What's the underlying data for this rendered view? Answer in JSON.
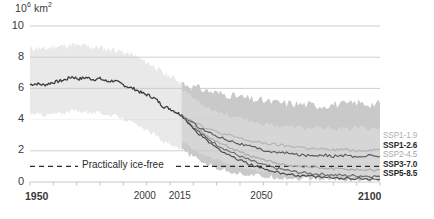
{
  "chart_data": {
    "type": "line",
    "title": "",
    "subtitle": "",
    "unit_label_prefix": "10",
    "unit_label_sup": "6",
    "unit_label_suffix": " km",
    "unit_label_suffix_sup": "2",
    "ylabel": "10^6 km^2",
    "xlabel": "",
    "ylim": [
      0,
      10
    ],
    "xlim": [
      1950,
      2100
    ],
    "yticks": [
      0,
      2,
      4,
      6,
      8,
      10
    ],
    "xticks": [
      1950,
      2000,
      2015,
      2050,
      2100
    ],
    "xtick_minor_step": 10,
    "grid": "horizontal",
    "legend_position": "right",
    "annotations": [
      {
        "label": "Practically ice-free",
        "y": 1.0,
        "style": "dashed"
      }
    ],
    "historical": {
      "name": "Historical",
      "color": "#3c3c3c",
      "band_color": "#e9e9e9",
      "x": [
        1950,
        1953,
        1956,
        1959,
        1962,
        1965,
        1968,
        1971,
        1974,
        1977,
        1980,
        1983,
        1986,
        1989,
        1992,
        1995,
        1998,
        2001,
        2004,
        2007,
        2010,
        2013,
        2015
      ],
      "values": [
        6.25,
        6.3,
        6.22,
        6.35,
        6.45,
        6.55,
        6.75,
        6.6,
        6.7,
        6.58,
        6.62,
        6.45,
        6.5,
        6.3,
        6.1,
        5.95,
        5.7,
        5.55,
        5.3,
        4.85,
        4.7,
        4.45,
        4.3
      ],
      "band_lower": [
        4.4,
        4.35,
        4.3,
        4.35,
        4.4,
        4.45,
        4.6,
        4.5,
        4.55,
        4.4,
        4.45,
        4.3,
        4.25,
        4.1,
        3.95,
        3.7,
        3.45,
        3.2,
        3.0,
        2.6,
        2.45,
        2.2,
        2.05
      ],
      "band_upper": [
        8.55,
        8.6,
        8.5,
        8.65,
        8.7,
        8.72,
        8.8,
        8.7,
        8.72,
        8.62,
        8.65,
        8.5,
        8.52,
        8.35,
        8.2,
        8.05,
        7.8,
        7.6,
        7.35,
        6.95,
        6.8,
        6.55,
        6.4
      ]
    },
    "series": [
      {
        "name": "SSP1-1.9",
        "color": "#b3b3b3",
        "label_color": "#b0b0b0",
        "bold": false,
        "x": [
          2015,
          2020,
          2025,
          2030,
          2035,
          2040,
          2045,
          2050,
          2055,
          2060,
          2065,
          2070,
          2075,
          2080,
          2085,
          2090,
          2095,
          2100
        ],
        "values": [
          4.3,
          3.9,
          3.5,
          3.2,
          3.0,
          2.8,
          2.6,
          2.5,
          2.4,
          2.3,
          2.25,
          2.15,
          2.1,
          2.05,
          2.1,
          2.0,
          2.05,
          2.1
        ]
      },
      {
        "name": "SSP1-2.6",
        "color": "#5a5a5a",
        "label_color": "#2b2b2b",
        "bold": true,
        "x": [
          2015,
          2020,
          2025,
          2030,
          2035,
          2040,
          2045,
          2050,
          2055,
          2060,
          2065,
          2070,
          2075,
          2080,
          2085,
          2090,
          2095,
          2100
        ],
        "values": [
          4.3,
          3.75,
          3.3,
          2.95,
          2.7,
          2.45,
          2.25,
          2.05,
          1.9,
          1.85,
          1.75,
          1.7,
          1.75,
          1.65,
          1.7,
          1.6,
          1.7,
          1.65
        ]
      },
      {
        "name": "SSP2-4.5",
        "color": "#aaaaaa",
        "label_color": "#a8a8a8",
        "bold": false,
        "x": [
          2015,
          2020,
          2025,
          2030,
          2035,
          2040,
          2045,
          2050,
          2055,
          2060,
          2065,
          2070,
          2075,
          2080,
          2085,
          2090,
          2095,
          2100
        ],
        "values": [
          4.3,
          3.6,
          3.05,
          2.6,
          2.25,
          1.9,
          1.65,
          1.4,
          1.25,
          1.1,
          1.0,
          0.95,
          0.9,
          0.85,
          0.82,
          0.8,
          0.78,
          0.75
        ]
      },
      {
        "name": "SSP3-7.0",
        "color": "#6a6a6a",
        "label_color": "#2b2b2b",
        "bold": true,
        "x": [
          2015,
          2020,
          2025,
          2030,
          2035,
          2040,
          2045,
          2050,
          2055,
          2060,
          2065,
          2070,
          2075,
          2080,
          2085,
          2090,
          2095,
          2100
        ],
        "values": [
          4.3,
          3.5,
          2.9,
          2.4,
          2.0,
          1.65,
          1.35,
          1.1,
          0.9,
          0.75,
          0.62,
          0.55,
          0.5,
          0.45,
          0.42,
          0.4,
          0.38,
          0.36
        ]
      },
      {
        "name": "SSP5-8.5",
        "color": "#4a4a4a",
        "label_color": "#1f1f1f",
        "bold": true,
        "x": [
          2015,
          2020,
          2025,
          2030,
          2035,
          2040,
          2045,
          2050,
          2055,
          2060,
          2065,
          2070,
          2075,
          2080,
          2085,
          2090,
          2095,
          2100
        ],
        "values": [
          4.3,
          3.4,
          2.75,
          2.2,
          1.75,
          1.4,
          1.1,
          0.85,
          0.65,
          0.52,
          0.42,
          0.35,
          0.3,
          0.26,
          0.24,
          0.22,
          0.2,
          0.18
        ]
      }
    ],
    "projection_band": {
      "color": "#c9c9c9",
      "secondary_color": "#d8d8d8",
      "x": [
        2015,
        2020,
        2025,
        2030,
        2035,
        2040,
        2045,
        2050,
        2055,
        2060,
        2065,
        2070,
        2075,
        2080,
        2085,
        2090,
        2095,
        2100
      ],
      "upper": [
        6.4,
        6.1,
        5.9,
        5.7,
        5.6,
        5.45,
        5.3,
        5.2,
        5.1,
        5.05,
        5.0,
        4.95,
        4.9,
        5.0,
        4.95,
        5.1,
        5.0,
        5.05
      ],
      "lower": [
        2.05,
        1.6,
        1.2,
        0.9,
        0.7,
        0.55,
        0.45,
        0.35,
        0.3,
        0.25,
        0.22,
        0.2,
        0.18,
        0.16,
        0.15,
        0.14,
        0.13,
        0.12
      ],
      "inner_upper": [
        6.0,
        5.4,
        4.9,
        4.55,
        4.3,
        4.05,
        3.9,
        3.75,
        3.65,
        3.55,
        3.5,
        3.45,
        3.4,
        3.45,
        3.4,
        3.5,
        3.45,
        3.5
      ],
      "inner_lower": [
        2.6,
        2.1,
        1.7,
        1.4,
        1.15,
        0.95,
        0.8,
        0.68,
        0.58,
        0.5,
        0.45,
        0.4,
        0.36,
        0.33,
        0.31,
        0.29,
        0.28,
        0.27
      ]
    }
  },
  "axis": {
    "ytick_labels": [
      "10",
      "8",
      "6",
      "4",
      "2",
      "0"
    ],
    "xtick_labels": [
      "1950",
      "2000",
      "2015",
      "2050",
      "2100"
    ]
  },
  "legend": {
    "items": [
      {
        "label": "SSP1-1.9"
      },
      {
        "label": "SSP1-2.6"
      },
      {
        "label": "SSP2-4.5"
      },
      {
        "label": "SSP3-7.0"
      },
      {
        "label": "SSP5-8.5"
      }
    ]
  },
  "annotation": {
    "ice_free_label": "Practically ice-free"
  }
}
